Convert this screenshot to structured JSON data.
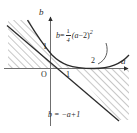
{
  "figure": {
    "kind": "math-diagram",
    "background": "#ffffff",
    "ink_color": "#2b2b2b",
    "hatch_color": "#6b6b6b",
    "axes": {
      "x_axis_name": "a",
      "y_axis_name": "b",
      "origin_label": "O",
      "x_ticks": [
        {
          "label": "1",
          "value": 1
        },
        {
          "label": "2",
          "value": 2
        }
      ],
      "y_ticks": [
        {
          "label": "1",
          "value": 1
        }
      ],
      "x_range": [
        -2.3,
        3.7
      ],
      "y_range": [
        -2.8,
        2.5
      ]
    },
    "curves": [
      {
        "name": "parabola",
        "equation_text": "b = 1/4 (a - 2)^2",
        "lhs": "b",
        "equals": "=",
        "frac_num": "1",
        "frac_den": "4",
        "body": "(a",
        "minus": "−",
        "body2": "2)",
        "exponent": "2",
        "vertex": [
          2,
          0
        ],
        "coefficient": 0.25
      },
      {
        "name": "line",
        "equation_text": "b = -a + 1",
        "label": "b = −a+1",
        "slope": -1,
        "intercept": 1
      }
    ],
    "shaded_regions": [
      {
        "name": "upper-left-region",
        "hatch": "diagonal-45"
      },
      {
        "name": "lower-right-region",
        "hatch": "diagonal-45"
      }
    ]
  }
}
